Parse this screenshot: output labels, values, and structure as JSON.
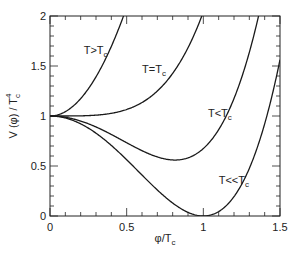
{
  "chart_data": {
    "type": "line",
    "title": "",
    "xlabel": {
      "main": "φ/T",
      "sub": "c"
    },
    "ylabel": {
      "main": "V (φ) / T",
      "sub": "c",
      "sup": "4"
    },
    "xlim": [
      0,
      1.5
    ],
    "ylim": [
      0,
      2
    ],
    "x_major_ticks": [
      0,
      0.5,
      1,
      1.5
    ],
    "x_tick_labels": [
      "0",
      "0.5",
      "1",
      "1.5"
    ],
    "y_major_ticks": [
      0,
      0.5,
      1,
      1.5,
      2
    ],
    "y_tick_labels": [
      "0",
      "0.5",
      "1",
      "1.5",
      "2"
    ],
    "minor_tick_step": 0.1,
    "grid": false,
    "legend": "none",
    "series": [
      {
        "name": "T>Tc",
        "label_main": "T>T",
        "label_sub": "c",
        "label_at": [
          0.22,
          1.62
        ],
        "model": "V = 1 + aφ² + bφ³ + cφ⁴",
        "coeffs": {
          "a": 4.35,
          "b": 0,
          "c": 0
        },
        "key_points": [
          [
            0,
            1
          ],
          [
            0.23,
            1.23
          ],
          [
            0.48,
            2.0
          ]
        ]
      },
      {
        "name": "T=Tc",
        "label_main": "T=T",
        "label_sub": "c",
        "label_at": [
          0.6,
          1.43
        ],
        "model": "V = 1 + aφ² + bφ³ + cφ⁴",
        "coeffs": {
          "a": 0,
          "b": 0,
          "c": 1.04
        },
        "key_points": [
          [
            0,
            1
          ],
          [
            0.72,
            1.28
          ],
          [
            0.99,
            2.0
          ]
        ]
      },
      {
        "name": "T<Tc",
        "label_main": "T<T",
        "label_sub": "c",
        "label_at": [
          1.03,
          0.99
        ],
        "model": "V = 1 + aφ² + bφ³ + cφ⁴",
        "coeffs": {
          "a": -1.279,
          "b": -0.114,
          "c": 1.0674
        },
        "key_points": [
          [
            0,
            1
          ],
          [
            0.815,
            0.56
          ],
          [
            1.23,
            1.3
          ],
          [
            1.36,
            2.0
          ]
        ]
      },
      {
        "name": "T<<Tc",
        "label_main": "T<<T",
        "label_sub": "c",
        "label_at": [
          1.1,
          0.32
        ],
        "model": "V = 1 + aφ² + bφ³ + cφ⁴",
        "coeffs": {
          "a": -2,
          "b": 0,
          "c": 1
        },
        "key_points": [
          [
            0,
            1
          ],
          [
            1.0,
            0.0
          ],
          [
            1.5,
            1.5625
          ]
        ]
      }
    ]
  }
}
